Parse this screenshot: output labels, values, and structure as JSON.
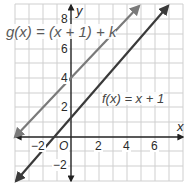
{
  "graph": {
    "x_axis_label": "x",
    "y_axis_label": "y",
    "origin_label": "O",
    "x_ticks": [
      "−2",
      "2",
      "4",
      "6"
    ],
    "y_ticks": [
      "8",
      "6",
      "4",
      "2",
      "−2"
    ],
    "functions": [
      {
        "label": "g(x) = (x + 1) + k",
        "color": "#7a7a7a"
      },
      {
        "label": "f(x) = x + 1",
        "color": "#3a3a3a"
      }
    ],
    "grid": {
      "xmin": -3,
      "xmax": 8,
      "ymin": -3,
      "ymax": 9,
      "step": 1
    }
  }
}
